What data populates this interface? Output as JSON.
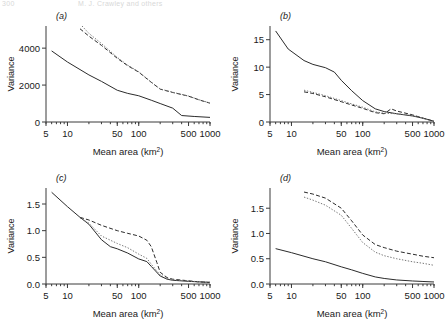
{
  "header": {
    "left": "300",
    "right": "M. J. Crawley and others"
  },
  "figure": {
    "xtitle": "Mean area (km",
    "xtitle_sup": "2",
    "xtitle_close": ")",
    "ylabel": "Variance"
  },
  "chart_data": [
    {
      "type": "line",
      "panel_label": "(a)",
      "title": "",
      "xlabel": "Mean area (km2)",
      "ylabel": "Variance",
      "xscale": "log",
      "xlim": [
        5,
        1000
      ],
      "ylim": [
        0,
        5200
      ],
      "xticks": [
        5,
        10,
        50,
        100,
        500,
        1000
      ],
      "xticklabels": [
        "5",
        "10",
        "50",
        "100",
        "500",
        "1000"
      ],
      "yticks": [
        0,
        2000,
        4000
      ],
      "yticklabels": [
        "0",
        "2000",
        "4000"
      ],
      "grid": false,
      "legend": "none",
      "series": [
        {
          "name": "solid",
          "style": "solid",
          "x": [
            6,
            10,
            20,
            30,
            50,
            70,
            100,
            150,
            200,
            300,
            400,
            600,
            1000
          ],
          "y": [
            3850,
            3250,
            2550,
            2200,
            1720,
            1550,
            1420,
            1180,
            1000,
            750,
            350,
            300,
            250
          ]
        },
        {
          "name": "dashed",
          "style": "dashed",
          "x": [
            15,
            20,
            30,
            50,
            70,
            100,
            150,
            200,
            300,
            500,
            700,
            1000
          ],
          "y": [
            5050,
            4650,
            4150,
            3450,
            3050,
            2700,
            2150,
            1780,
            1600,
            1400,
            1200,
            1020
          ]
        },
        {
          "name": "dotted",
          "style": "dotted",
          "x": [
            16,
            20,
            30,
            50,
            70,
            100,
            150,
            200,
            300,
            500,
            700,
            1000
          ],
          "y": [
            5200,
            4800,
            4250,
            3500,
            3080,
            2720,
            2160,
            1790,
            1610,
            1405,
            1205,
            1030
          ]
        }
      ]
    },
    {
      "type": "line",
      "panel_label": "(b)",
      "title": "",
      "xlabel": "Mean area (km2)",
      "ylabel": "Variance",
      "xscale": "log",
      "xlim": [
        5,
        1000
      ],
      "ylim": [
        0,
        17.5
      ],
      "xticks": [
        5,
        10,
        50,
        100,
        500,
        1000
      ],
      "xticklabels": [
        "5",
        "10",
        "50",
        "100",
        "500",
        "1000"
      ],
      "yticks": [
        0,
        5,
        10,
        15
      ],
      "yticklabels": [
        "0",
        "5",
        "10",
        "15"
      ],
      "grid": false,
      "legend": "none",
      "series": [
        {
          "name": "solid",
          "style": "solid",
          "x": [
            6,
            9,
            15,
            20,
            30,
            40,
            50,
            70,
            100,
            150,
            200,
            300,
            500,
            700,
            1000
          ],
          "y": [
            16.6,
            13.3,
            11.2,
            10.5,
            9.9,
            9.1,
            7.6,
            5.7,
            3.9,
            2.4,
            1.9,
            1.5,
            1.1,
            0.7,
            0.15
          ]
        },
        {
          "name": "dashed",
          "style": "dashed",
          "x": [
            15,
            20,
            30,
            50,
            70,
            100,
            150,
            200,
            250,
            300,
            500,
            700,
            1000
          ],
          "y": [
            5.5,
            5.2,
            4.6,
            3.7,
            3.1,
            2.5,
            1.7,
            1.5,
            2.4,
            2.0,
            1.3,
            0.7,
            0.12
          ]
        },
        {
          "name": "dotted",
          "style": "dotted",
          "x": [
            15,
            20,
            30,
            50,
            70,
            100,
            150,
            200,
            300,
            500,
            700,
            1000
          ],
          "y": [
            5.8,
            5.4,
            4.8,
            3.9,
            3.3,
            2.7,
            1.85,
            1.6,
            1.5,
            1.2,
            0.65,
            0.1
          ]
        }
      ]
    },
    {
      "type": "line",
      "panel_label": "(c)",
      "title": "",
      "xlabel": "Mean area (km2)",
      "ylabel": "Variance",
      "xscale": "log",
      "xlim": [
        5,
        1000
      ],
      "ylim": [
        0,
        1.8
      ],
      "xticks": [
        5,
        10,
        50,
        100,
        500,
        1000
      ],
      "xticklabels": [
        "5",
        "10",
        "50",
        "100",
        "500",
        "1000"
      ],
      "yticks": [
        0.0,
        0.5,
        1.0,
        1.5
      ],
      "yticklabels": [
        "0.0",
        "0.5",
        "1.0",
        "1.5"
      ],
      "grid": false,
      "legend": "none",
      "series": [
        {
          "name": "solid",
          "style": "solid",
          "x": [
            6,
            10,
            15,
            20,
            30,
            40,
            50,
            70,
            100,
            130,
            150,
            200,
            250,
            300,
            500,
            700,
            1000
          ],
          "y": [
            1.72,
            1.45,
            1.25,
            1.12,
            0.83,
            0.7,
            0.66,
            0.58,
            0.47,
            0.42,
            0.33,
            0.15,
            0.09,
            0.07,
            0.05,
            0.04,
            0.03
          ]
        },
        {
          "name": "dashed",
          "style": "dashed",
          "x": [
            15,
            20,
            30,
            50,
            70,
            100,
            130,
            150,
            180,
            200,
            250,
            300,
            500,
            700,
            1000
          ],
          "y": [
            1.25,
            1.2,
            1.1,
            1.0,
            0.95,
            0.9,
            0.82,
            0.7,
            0.4,
            0.22,
            0.12,
            0.09,
            0.06,
            0.04,
            0.03
          ]
        },
        {
          "name": "dotted",
          "style": "dotted",
          "x": [
            15,
            20,
            30,
            50,
            70,
            100,
            130,
            150,
            200,
            250,
            300,
            500,
            700,
            1000
          ],
          "y": [
            1.24,
            1.14,
            0.9,
            0.76,
            0.68,
            0.56,
            0.48,
            0.37,
            0.17,
            0.1,
            0.08,
            0.055,
            0.042,
            0.032
          ]
        }
      ]
    },
    {
      "type": "line",
      "panel_label": "(d)",
      "title": "",
      "xlabel": "Mean area (km2)",
      "ylabel": "Variance",
      "xscale": "log",
      "xlim": [
        5,
        1000
      ],
      "ylim": [
        0,
        1.9
      ],
      "xticks": [
        5,
        10,
        50,
        100,
        500,
        1000
      ],
      "xticklabels": [
        "5",
        "10",
        "50",
        "100",
        "500",
        "1000"
      ],
      "yticks": [
        0.0,
        0.5,
        1.0,
        1.5
      ],
      "yticklabels": [
        "0.0",
        "0.5",
        "1.0",
        "1.5"
      ],
      "grid": false,
      "legend": "none",
      "series": [
        {
          "name": "solid",
          "style": "solid",
          "x": [
            6,
            10,
            20,
            30,
            50,
            70,
            100,
            150,
            200,
            300,
            500,
            700,
            1000
          ],
          "y": [
            0.7,
            0.62,
            0.5,
            0.44,
            0.34,
            0.28,
            0.21,
            0.14,
            0.11,
            0.08,
            0.06,
            0.05,
            0.04
          ]
        },
        {
          "name": "dashed",
          "style": "dashed",
          "x": [
            15,
            20,
            30,
            50,
            70,
            100,
            150,
            200,
            300,
            500,
            700,
            1000
          ],
          "y": [
            1.82,
            1.78,
            1.7,
            1.5,
            1.25,
            0.97,
            0.78,
            0.72,
            0.65,
            0.59,
            0.55,
            0.52
          ]
        },
        {
          "name": "dotted",
          "style": "dotted",
          "x": [
            15,
            20,
            30,
            50,
            70,
            100,
            150,
            200,
            300,
            500,
            700,
            1000
          ],
          "y": [
            1.72,
            1.66,
            1.56,
            1.36,
            1.1,
            0.82,
            0.63,
            0.56,
            0.5,
            0.44,
            0.41,
            0.37
          ]
        }
      ]
    }
  ]
}
